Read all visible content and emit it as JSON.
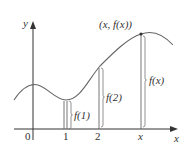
{
  "figure": {
    "type": "function-graph",
    "axes": {
      "x_label": "x",
      "y_label": "y",
      "origin_label": "0",
      "ticks": [
        "1",
        "2",
        "x"
      ]
    },
    "point_label": "(x, f(x))",
    "brackets": [
      {
        "at": "1",
        "label": "f(1)"
      },
      {
        "at": "2",
        "label": "f(2)"
      },
      {
        "at": "x",
        "label": "f(x)"
      }
    ],
    "colors": {
      "curve": "#555555",
      "axes": "#333333",
      "text": "#333333"
    }
  }
}
